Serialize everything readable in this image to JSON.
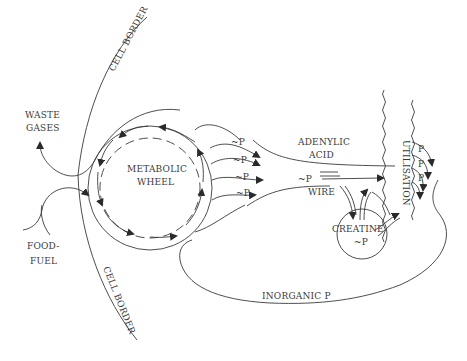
{
  "diagram": {
    "labels": {
      "cell_border_top": "CELL BORDER",
      "cell_border_bottom": "CELL BORDER",
      "waste_gases_line1": "WASTE",
      "waste_gases_line2": "GASES",
      "food_fuel_line1": "FOOD-",
      "food_fuel_line2": "FUEL",
      "metabolic_line1": "METABOLIC",
      "metabolic_line2": "WHEEL",
      "adenylic_line1": "ADENYLIC",
      "adenylic_line2": "ACID",
      "wire_p": "~P",
      "wire": "WIRE",
      "creatine": "CREATINE",
      "creatine_p": "~P",
      "utilisation": "UTILISATION",
      "inorganic_p": "INORGANIC P",
      "phosphate_bonds": [
        "~P",
        "~P",
        "~P",
        "~P"
      ],
      "utilisation_p": [
        "P",
        "P",
        "P"
      ]
    },
    "colors": {
      "line": "#3a3a3a",
      "text": "#3a3a3a",
      "background": "#ffffff"
    }
  }
}
